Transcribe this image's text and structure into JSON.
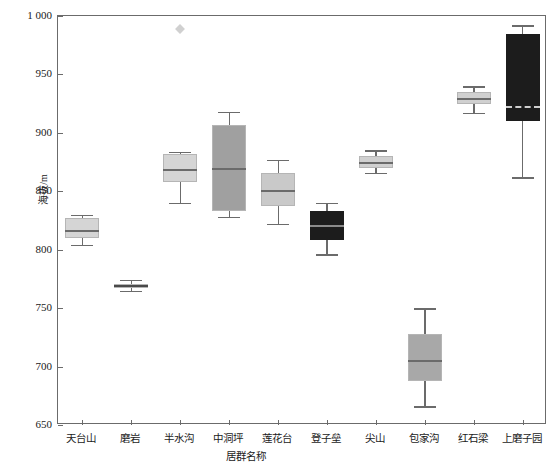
{
  "chart_data": {
    "type": "box",
    "title": "",
    "xlabel": "居群名称",
    "ylabel": "海拔/m",
    "ylim": [
      650,
      1000
    ],
    "ytick_values": [
      650,
      700,
      750,
      800,
      850,
      900,
      950,
      1000
    ],
    "ytick_labels": [
      "650",
      "700",
      "750",
      "800",
      "850",
      "900",
      "950",
      "1 000"
    ],
    "grid": false,
    "legend": "none",
    "categories": [
      "天台山",
      "磨岩",
      "半水沟",
      "中洞坪",
      "莲花台",
      "登子垒",
      "尖山",
      "包家沟",
      "红石梁",
      "上磨子园"
    ],
    "boxes": [
      {
        "category": "天台山",
        "whisker_low": 804,
        "q1": 810,
        "median": 816,
        "q3": 827,
        "whisker_high": 830,
        "fill": "#d5d5d5",
        "median_color": "#6b6b6b",
        "outliers": []
      },
      {
        "category": "磨岩",
        "whisker_low": 765,
        "q1": 767,
        "median": 769,
        "q3": 771,
        "whisker_high": 774,
        "fill": "#777777",
        "median_color": "#4a4a4a",
        "outliers": []
      },
      {
        "category": "半水沟",
        "whisker_low": 840,
        "q1": 858,
        "median": 868,
        "q3": 882,
        "whisker_high": 884,
        "fill": "#d5d5d5",
        "median_color": "#6b6b6b",
        "outliers": [
          989
        ]
      },
      {
        "category": "中洞坪",
        "whisker_low": 828,
        "q1": 833,
        "median": 869,
        "q3": 907,
        "whisker_high": 918,
        "fill": "#a0a0a0",
        "median_color": "#6b6b6b",
        "outliers": []
      },
      {
        "category": "莲花台",
        "whisker_low": 822,
        "q1": 837,
        "median": 850,
        "q3": 866,
        "whisker_high": 877,
        "fill": "#c9c9c9",
        "median_color": "#6b6b6b",
        "outliers": []
      },
      {
        "category": "登子垒",
        "whisker_low": 796,
        "q1": 808,
        "median": 820,
        "q3": 833,
        "whisker_high": 840,
        "fill": "#1c1c1c",
        "median_color": "#8a8a8a",
        "outliers": []
      },
      {
        "category": "尖山",
        "whisker_low": 866,
        "q1": 870,
        "median": 874,
        "q3": 880,
        "whisker_high": 885,
        "fill": "#d0d0d0",
        "median_color": "#6b6b6b",
        "outliers": []
      },
      {
        "category": "包家沟",
        "whisker_low": 666,
        "q1": 688,
        "median": 705,
        "q3": 728,
        "whisker_high": 750,
        "fill": "#a8a8a8",
        "median_color": "#6b6b6b",
        "outliers": []
      },
      {
        "category": "红石梁",
        "whisker_low": 917,
        "q1": 925,
        "median": 929,
        "q3": 935,
        "whisker_high": 940,
        "fill": "#d0d0d0",
        "median_color": "#6b6b6b",
        "outliers": []
      },
      {
        "category": "上磨子园",
        "whisker_low": 862,
        "q1": 910,
        "median": 922,
        "q3": 985,
        "whisker_high": 992,
        "fill": "#1c1c1c",
        "median_color": "#cfcfcf",
        "outliers": []
      }
    ]
  },
  "axes": {
    "frame_color": "#6b6b6b",
    "text_color": "#1a1a1a"
  }
}
